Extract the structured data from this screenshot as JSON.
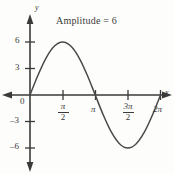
{
  "figure": {
    "title": "Amplitude = 6",
    "x_axis_label": "x",
    "y_axis_label": "y",
    "origin_label": "0",
    "background_color": "#fdfdfb",
    "curve_color": "#4a4a4a",
    "axis_color": "#3a3a3a"
  },
  "ticks": {
    "y": [
      {
        "label": "6",
        "value": 6
      },
      {
        "label": "3",
        "value": 3
      },
      {
        "label": "–3",
        "value": -3
      },
      {
        "label": "–6",
        "value": -6
      }
    ],
    "x": [
      {
        "num": "π",
        "den": "2",
        "plain": "",
        "value": 1.5707963
      },
      {
        "num": "",
        "den": "",
        "plain": "π",
        "value": 3.1415927
      },
      {
        "num": "3π",
        "den": "2",
        "plain": "",
        "value": 4.712389
      },
      {
        "num": "",
        "den": "",
        "plain": "2π",
        "value": 6.2831853
      }
    ]
  },
  "chart_data": {
    "type": "line",
    "title": "Amplitude = 6",
    "xlabel": "x",
    "ylabel": "y",
    "function": "y = 6 sin(x)",
    "amplitude": 6,
    "period": "2π",
    "xlim": [
      0,
      6.2831853
    ],
    "ylim": [
      -6,
      6
    ],
    "grid": false,
    "legend": "none",
    "xtick_labels": [
      "π/2",
      "π",
      "3π/2",
      "2π"
    ],
    "xtick_values": [
      1.5707963,
      3.1415927,
      4.712389,
      6.2831853
    ],
    "ytick_labels": [
      "6",
      "3",
      "–3",
      "–6"
    ],
    "ytick_values": [
      6,
      3,
      -3,
      -6
    ],
    "x": [
      0,
      0.3926991,
      0.7853982,
      1.1780972,
      1.5707963,
      1.9634954,
      2.3561945,
      2.7488936,
      3.1415927,
      3.5342917,
      3.9269908,
      4.3196899,
      4.712389,
      5.1050881,
      5.4977871,
      5.8904862,
      6.2831853
    ],
    "series": [
      {
        "name": "y = 6 sin(x)",
        "values": [
          0,
          2.296,
          4.243,
          5.543,
          6,
          5.543,
          4.243,
          2.296,
          0,
          -2.296,
          -4.243,
          -5.543,
          -6,
          -5.543,
          -4.243,
          -2.296,
          0
        ]
      }
    ],
    "annotations": [
      {
        "text": "Amplitude = 6",
        "position": "top-center"
      }
    ]
  }
}
